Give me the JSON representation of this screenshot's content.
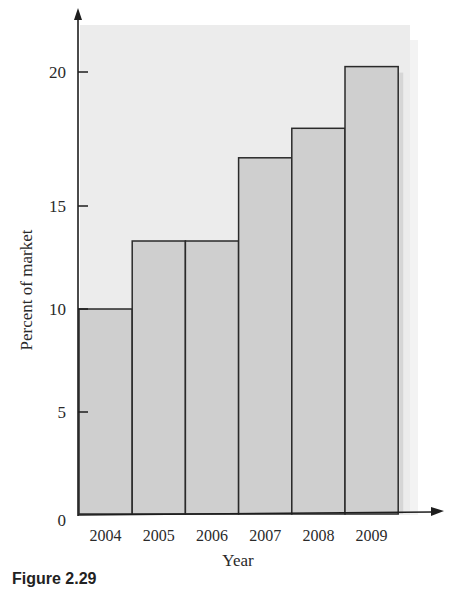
{
  "chart_data": {
    "type": "bar",
    "title": "",
    "xlabel": "Year",
    "ylabel": "Percent of market",
    "categories": [
      "2004",
      "2005",
      "2006",
      "2007",
      "2008",
      "2009"
    ],
    "values": [
      10.0,
      13.3,
      13.3,
      16.8,
      17.9,
      20.2
    ],
    "ylim": [
      0,
      22
    ],
    "yticks": [
      0,
      5,
      10,
      15,
      20
    ],
    "grid": false,
    "legend": null,
    "bar_style": "histogram (adjacent bars, no gaps)",
    "colors": {
      "bar_fill": "#cfcfcf",
      "bar_stroke": "#2a2a2a",
      "plot_background": "#ececec",
      "axis": "#1e1e1e"
    }
  },
  "caption": "Figure 2.29"
}
